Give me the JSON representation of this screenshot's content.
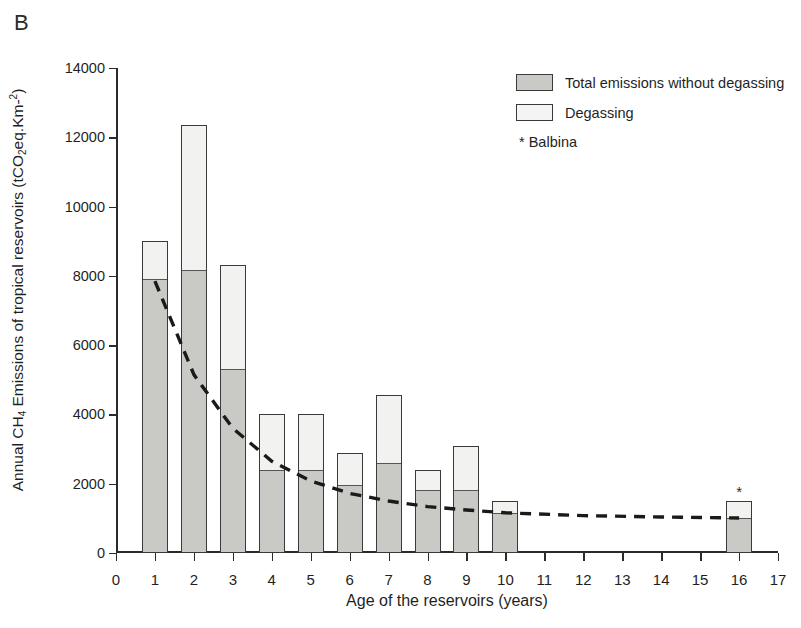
{
  "panel": {
    "label": "B"
  },
  "legend": {
    "items": [
      {
        "label": "Total emissions without degassing",
        "swatch": "gray",
        "color": "#c9c9c6"
      },
      {
        "label": "Degassing",
        "swatch": "white",
        "color": "#f4f4f2"
      }
    ],
    "note": "* Balbina"
  },
  "axis": {
    "y_title_parts": {
      "p1": "Annual CH",
      "sub1": "4",
      "p2": " Emissions of tropical reservoirs (tCO",
      "sub2": "2",
      "p3": "eq.Km-",
      "sup1": "2",
      "p4": ")"
    },
    "x_title": "Age of the reservoirs (years)"
  },
  "chart_data": {
    "type": "bar",
    "title": "B",
    "xlabel": "Age of the reservoirs (years)",
    "ylabel": "Annual CH4 Emissions of tropical reservoirs (tCO2eq.Km-2)",
    "xlim": [
      0,
      17
    ],
    "ylim": [
      0,
      14000
    ],
    "x_ticks": [
      0,
      1,
      2,
      3,
      4,
      5,
      6,
      7,
      8,
      9,
      10,
      11,
      12,
      13,
      14,
      15,
      16,
      17
    ],
    "y_ticks": [
      0,
      2000,
      4000,
      6000,
      8000,
      10000,
      12000,
      14000
    ],
    "grid": false,
    "stacked": true,
    "legend_position": "top-right",
    "categories": [
      1,
      2,
      3,
      4,
      5,
      6,
      7,
      8,
      9,
      10,
      16
    ],
    "series": [
      {
        "name": "Total emissions without degassing",
        "color": "#c9c9c6",
        "values": [
          7850,
          8100,
          5250,
          2350,
          2350,
          1900,
          2550,
          1750,
          1750,
          1100,
          950
        ]
      },
      {
        "name": "Degassing",
        "color": "#f4f4f2",
        "values": [
          1150,
          4250,
          3050,
          1650,
          1650,
          1000,
          2000,
          650,
          1350,
          400,
          550
        ]
      }
    ],
    "totals": [
      9000,
      12350,
      8300,
      4000,
      4000,
      2900,
      4550,
      2400,
      3100,
      1500,
      1500
    ],
    "annotations": [
      {
        "text": "*",
        "x": 16,
        "y": 1500,
        "note": "Balbina"
      }
    ],
    "trendline": {
      "style": "dashed",
      "color": "#1a1a1a",
      "description": "exponential decay fit through total emissions without degassing",
      "points": [
        {
          "x": 1,
          "y": 7850
        },
        {
          "x": 2,
          "y": 5150
        },
        {
          "x": 3,
          "y": 3600
        },
        {
          "x": 4,
          "y": 2650
        },
        {
          "x": 5,
          "y": 2080
        },
        {
          "x": 6,
          "y": 1720
        },
        {
          "x": 7,
          "y": 1500
        },
        {
          "x": 8,
          "y": 1340
        },
        {
          "x": 9,
          "y": 1240
        },
        {
          "x": 10,
          "y": 1160
        },
        {
          "x": 12,
          "y": 1080
        },
        {
          "x": 14,
          "y": 1040
        },
        {
          "x": 16,
          "y": 1010
        }
      ]
    }
  }
}
